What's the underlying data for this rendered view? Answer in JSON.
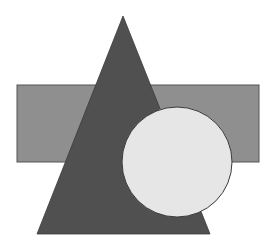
{
  "canvas": {
    "width": 279,
    "height": 250,
    "background": "#ffffff"
  },
  "shapes": {
    "rectangle": {
      "x": 17,
      "y": 85,
      "width": 242,
      "height": 77,
      "fill": "#8f8f8f",
      "stroke": "#555555"
    },
    "triangle": {
      "points": "123,16 37,234 210,234",
      "fill": "#505050",
      "stroke": "#3a3a3a"
    },
    "circle": {
      "cx": 177,
      "cy": 162,
      "r": 55,
      "fill": "#e6e6e6",
      "stroke": "#3a3a3a"
    }
  }
}
